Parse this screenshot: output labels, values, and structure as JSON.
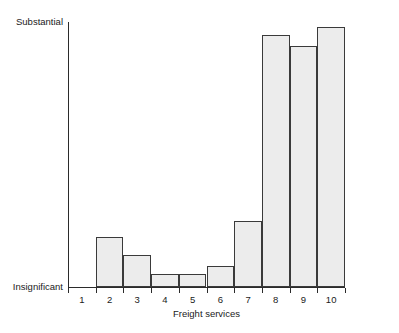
{
  "chart_data": {
    "type": "bar",
    "title": "",
    "xlabel": "Freight services",
    "ylabel": "",
    "categories": [
      "1",
      "2",
      "3",
      "4",
      "5",
      "6",
      "7",
      "8",
      "9",
      "10"
    ],
    "values": [
      0,
      0.19,
      0.12,
      0.05,
      0.05,
      0.08,
      0.25,
      0.95,
      0.91,
      0.98
    ],
    "ylim": [
      0,
      1
    ],
    "y_axis_scale_type": "ordinal",
    "y_tick_labels": [
      "Insignificant",
      "Substantial"
    ],
    "y_tick_label_bottom": "Insignificant",
    "y_tick_label_top": "Substantial",
    "grid": false,
    "legend": false,
    "bars_contiguous": true,
    "bar_fill_color": "#ececec",
    "bar_edge_color": "#3a3a3a",
    "background_color": "#ffffff"
  },
  "axis": {
    "x_title": "Freight services",
    "y_top_label": "Substantial",
    "y_bottom_label": "Insignificant"
  }
}
